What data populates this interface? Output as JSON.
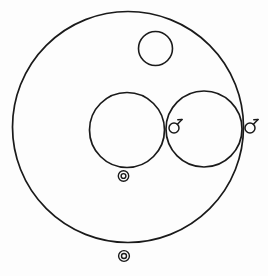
{
  "canvas": {
    "width": 268,
    "height": 276,
    "background_color": "#fdfdfd",
    "stroke_color": "#1a1a1a",
    "title": "Circle Diagram"
  },
  "chart_data": {
    "type": "scatter",
    "xlabel": "",
    "ylabel": "",
    "xlim": [
      0,
      268
    ],
    "ylim": [
      0,
      276
    ],
    "grid": false,
    "legend": "none",
    "shapes": [
      {
        "id": "outer-circle",
        "kind": "circle",
        "cx": 128,
        "cy": 127,
        "r": 115.5,
        "stroke_width": 1.7,
        "fill": "none",
        "label": "outer boundary circle"
      },
      {
        "id": "small-top-circle",
        "kind": "circle",
        "cx": 155.5,
        "cy": 48.5,
        "r": 17.0,
        "stroke_width": 1.6,
        "fill": "none",
        "label": "small upper circle"
      },
      {
        "id": "left-medium-circle",
        "kind": "circle",
        "cx": 127.0,
        "cy": 130.0,
        "r": 37.5,
        "stroke_width": 1.7,
        "fill": "none",
        "label": "left medium circle"
      },
      {
        "id": "right-medium-circle",
        "kind": "circle",
        "cx": 204.0,
        "cy": 129.0,
        "r": 38.0,
        "stroke_width": 1.7,
        "fill": "none",
        "label": "right medium circle"
      }
    ],
    "markers": [
      {
        "id": "tadpole-glyph-inner",
        "kind": "tadpole-glyph",
        "cx": 174.0,
        "cy": 128.0,
        "r": 5.0,
        "tail_dx": 8.0,
        "tail_dy": -8.5,
        "stroke_width": 1.5,
        "label": "mars-like glyph at tangency point"
      },
      {
        "id": "tadpole-glyph-outer",
        "kind": "tadpole-glyph",
        "cx": 250.0,
        "cy": 128.0,
        "r": 5.0,
        "tail_dx": 8.0,
        "tail_dy": -8.5,
        "stroke_width": 1.5,
        "label": "mars-like glyph at right boundary"
      },
      {
        "id": "concentric-marker-middle",
        "kind": "concentric-circles",
        "cx": 123.5,
        "cy": 176.0,
        "r_outer": 5.2,
        "r_inner": 2.4,
        "stroke_width": 1.4,
        "label": "concentric circle marker below left medium circle"
      },
      {
        "id": "concentric-marker-bottom",
        "kind": "concentric-circles",
        "cx": 124.0,
        "cy": 256.0,
        "r_outer": 5.4,
        "r_inner": 2.5,
        "stroke_width": 1.4,
        "label": "concentric circle marker below outer circle"
      }
    ],
    "annotations": [
      "left and right medium circles are tangent at approximately x=165",
      "right medium circle is internally tangent to the outer circle at the right",
      "small upper circle sits inside the outer circle near the top"
    ]
  }
}
